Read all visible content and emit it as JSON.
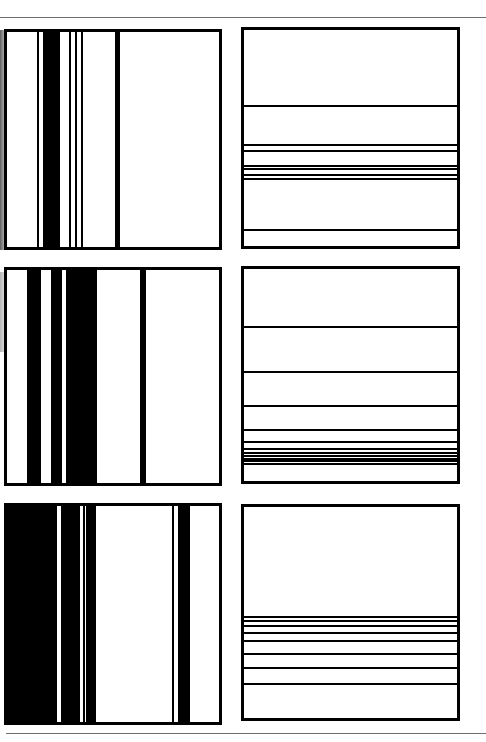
{
  "figure": {
    "colors": {
      "ink": "#000000",
      "paper": "#ffffff",
      "rule": "#6e6e6e"
    },
    "rules": [
      {
        "name": "top-rule",
        "y": 17,
        "x": 0,
        "width": 486
      },
      {
        "name": "bottom-rule",
        "y": 733,
        "x": 6,
        "width": 480
      }
    ],
    "panels": [
      {
        "name": "panel-top-left",
        "orientation": "vertical",
        "box": {
          "x": 4,
          "y": 29,
          "w": 218,
          "h": 221
        },
        "stripes": [
          {
            "pos": 30,
            "size": 2
          },
          {
            "pos": 36,
            "size": 17
          },
          {
            "pos": 62,
            "size": 1.5
          },
          {
            "pos": 68,
            "size": 1.5
          },
          {
            "pos": 74,
            "size": 1.5
          },
          {
            "pos": 108,
            "size": 4.5
          }
        ]
      },
      {
        "name": "panel-top-right",
        "orientation": "horizontal",
        "box": {
          "x": 241,
          "y": 27,
          "w": 219,
          "h": 222
        },
        "stripes": [
          {
            "pos": 75,
            "size": 1.5
          },
          {
            "pos": 114,
            "size": 1.5
          },
          {
            "pos": 120,
            "size": 1.5
          },
          {
            "pos": 135,
            "size": 1.5
          },
          {
            "pos": 138,
            "size": 1.5
          },
          {
            "pos": 144,
            "size": 1.5
          },
          {
            "pos": 148,
            "size": 1.5
          },
          {
            "pos": 199,
            "size": 1.5
          }
        ]
      },
      {
        "name": "panel-middle-left",
        "orientation": "vertical",
        "box": {
          "x": 4,
          "y": 267,
          "w": 218,
          "h": 219
        },
        "stripes": [
          {
            "pos": 20,
            "size": 14
          },
          {
            "pos": 44,
            "size": 11
          },
          {
            "pos": 59,
            "size": 31
          },
          {
            "pos": 133,
            "size": 6
          }
        ]
      },
      {
        "name": "panel-middle-right",
        "orientation": "horizontal",
        "box": {
          "x": 241,
          "y": 266,
          "w": 219,
          "h": 218
        },
        "stripes": [
          {
            "pos": 57,
            "size": 1.5
          },
          {
            "pos": 102,
            "size": 1.5
          },
          {
            "pos": 136,
            "size": 1.5
          },
          {
            "pos": 160,
            "size": 1.5
          },
          {
            "pos": 172,
            "size": 1.5
          },
          {
            "pos": 179,
            "size": 1.5
          },
          {
            "pos": 183,
            "size": 1.5
          },
          {
            "pos": 186,
            "size": 1.5
          },
          {
            "pos": 189,
            "size": 1.5
          },
          {
            "pos": 191,
            "size": 1.5
          },
          {
            "pos": 194,
            "size": 1.5
          }
        ]
      },
      {
        "name": "panel-bottom-left",
        "orientation": "vertical",
        "box": {
          "x": 4,
          "y": 503,
          "w": 218,
          "h": 222
        },
        "stripes": [
          {
            "pos": 0,
            "size": 50
          },
          {
            "pos": 54,
            "size": 19
          },
          {
            "pos": 76,
            "size": 1.5
          },
          {
            "pos": 79,
            "size": 10
          },
          {
            "pos": 165,
            "size": 2
          },
          {
            "pos": 171,
            "size": 12
          }
        ]
      },
      {
        "name": "panel-bottom-right",
        "orientation": "horizontal",
        "box": {
          "x": 241,
          "y": 504,
          "w": 219,
          "h": 217
        },
        "stripes": [
          {
            "pos": 109,
            "size": 1.5
          },
          {
            "pos": 113,
            "size": 1.5
          },
          {
            "pos": 118,
            "size": 1.5
          },
          {
            "pos": 125,
            "size": 1.5
          },
          {
            "pos": 133,
            "size": 1.5
          },
          {
            "pos": 146,
            "size": 1.5
          },
          {
            "pos": 160,
            "size": 1.5
          },
          {
            "pos": 176,
            "size": 1.5
          }
        ]
      }
    ]
  }
}
